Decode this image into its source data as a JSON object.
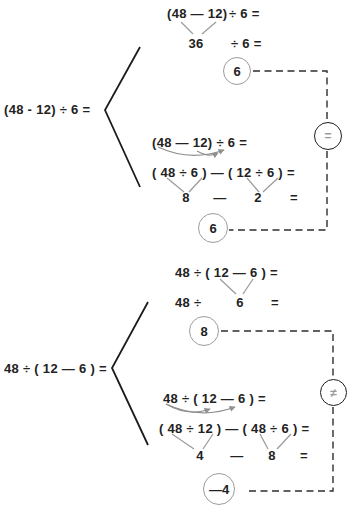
{
  "problem1": {
    "left_expression": "(48 - 12) ÷ 6 =",
    "method1": {
      "row1_lhs": "(48 — 12)",
      "row1_rhs": "÷ 6 =",
      "row2_value": "36",
      "row2_rhs": "÷ 6 =",
      "result": "6"
    },
    "method2": {
      "row1": "(48 — 12) ÷ 6 =",
      "row2": "( 48 ÷ 6 ) — ( 12 ÷ 6 ) =",
      "row3_term1": "8",
      "row3_op": "—",
      "row3_term2": "2",
      "row3_eq": "=",
      "result": "6"
    },
    "verdict": "="
  },
  "problem2": {
    "left_expression": "48 ÷ ( 12 — 6 ) =",
    "method1": {
      "row1": "48 ÷ ( 12 — 6 ) =",
      "row2_lhs": "48 ÷",
      "row2_value": "6",
      "row2_eq": "=",
      "result": "8"
    },
    "method2": {
      "row1": "48 ÷ ( 12 — 6 ) =",
      "row2": "( 48 ÷ 12 ) — ( 48 ÷ 6 ) =",
      "row3_term1": "4",
      "row3_op": "—",
      "row3_term2": "8",
      "row3_eq": "=",
      "result": "—4"
    },
    "verdict": "≠"
  },
  "colors": {
    "ink": "#222222",
    "gray_line": "#9c9c9c",
    "arrow": "#8f8f8f",
    "result_circle_border": "#9c9c9c",
    "verdict_circle_border": "#1c1c1c",
    "verdict_glyph": "#999999",
    "dashed_line": "#2e2e2e"
  }
}
